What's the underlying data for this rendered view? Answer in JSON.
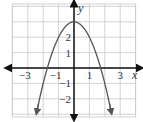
{
  "chart_data": {
    "type": "line",
    "title": "",
    "function": "y = 3 - x^2",
    "xlabel": "x",
    "ylabel": "y",
    "xlim": [
      -4,
      4
    ],
    "ylim": [
      -3.2,
      4.2
    ],
    "grid": true,
    "x_tick_labels": [
      {
        "value": -3,
        "label": "−3"
      },
      {
        "value": -1,
        "label": "−1"
      },
      {
        "value": 1,
        "label": "1"
      },
      {
        "value": 3,
        "label": "3"
      }
    ],
    "y_tick_labels": [
      {
        "value": 2,
        "label": "2"
      },
      {
        "value": 1,
        "label": "1"
      },
      {
        "value": -1,
        "label": "−1"
      },
      {
        "value": -2,
        "label": "−2"
      }
    ],
    "series": [
      {
        "name": "parabola",
        "x": [
          -2.4,
          -2,
          -1.5,
          -1,
          -0.5,
          0,
          0.5,
          1,
          1.5,
          2,
          2.4
        ],
        "y": [
          -2.76,
          -1,
          0.75,
          2,
          2.75,
          3,
          2.75,
          2,
          0.75,
          -1,
          -2.76
        ]
      }
    ],
    "colors": {
      "curve": "#555555",
      "axes": "#111111",
      "grid": "#c8c8c8"
    }
  }
}
